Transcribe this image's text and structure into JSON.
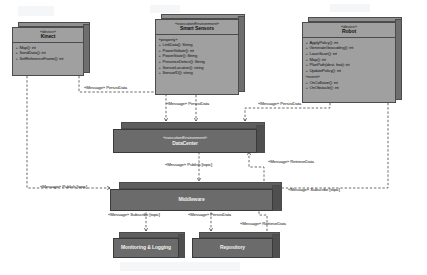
{
  "diagram": {
    "type": "uml-deployment",
    "palette": {
      "node_face": "#a0a0a0",
      "node_face_dark": "#6b6b6b",
      "node_top": "#8f8f8f",
      "node_side": "#6e6e6e",
      "outline": "#4b4b4b",
      "background": "#ffffff",
      "edge": "#2b2b2b"
    }
  },
  "nodes": [
    {
      "id": "kinect",
      "name": "Kinect",
      "stereotype": "«device»",
      "style": "light",
      "groups": [],
      "members": [
        "Map(): int",
        "SendData(): int",
        "SetReferenceFrame(): int"
      ]
    },
    {
      "id": "smart-sensors",
      "name": "Smart Sensors",
      "stereotype": "«executionEnvironment»",
      "style": "light",
      "groups": [
        {
          "label": "«property»",
          "members": [
            "LinkData(): String",
            "PowerVoltate(): int",
            "PowerState(): String",
            "PresenceDetect(): String",
            "SensorLocation(): string",
            "SensorID(): string"
          ]
        }
      ],
      "members": []
    },
    {
      "id": "robot",
      "name": "Robot",
      "stereotype": "«device»",
      "style": "light",
      "groups": [
        {
          "label": "",
          "members": [
            "ApplyPolicy(): int",
            "GenerateGeocoding(): int",
            "LaserScan(): int",
            "Map(): int",
            "PlanPath(dest, feat): int",
            "UpdatePolicy(): int"
          ]
        },
        {
          "label": "«event»",
          "members": [
            "OnCollision(): int",
            "OnObstacle(): int"
          ]
        }
      ],
      "members": []
    },
    {
      "id": "datacenter",
      "name": "DataCenter",
      "stereotype": "«executionEnvironment»",
      "style": "dark",
      "groups": [],
      "members": []
    },
    {
      "id": "middleware",
      "name": "Middleware",
      "stereotype": "",
      "style": "dark",
      "groups": [],
      "members": []
    },
    {
      "id": "monitoring",
      "name": "Monitoring & Logging",
      "stereotype": "",
      "style": "dark",
      "groups": [],
      "members": []
    },
    {
      "id": "repository",
      "name": "Repository",
      "stereotype": "",
      "style": "dark",
      "groups": [],
      "members": []
    }
  ],
  "edges": [
    {
      "id": "e1",
      "from": "kinect",
      "to": "datacenter",
      "label": "«Message» PersistData"
    },
    {
      "id": "e2",
      "from": "smart-sensors",
      "to": "datacenter",
      "label": "«Message» PersistData"
    },
    {
      "id": "e3",
      "from": "robot",
      "to": "datacenter",
      "label": "«Message» PersistData"
    },
    {
      "id": "e4",
      "from": "datacenter",
      "to": "middleware",
      "label": "«Message» Publish [topic]"
    },
    {
      "id": "e5",
      "from": "middleware",
      "to": "datacenter",
      "label": "«Message» RetrieveData"
    },
    {
      "id": "e6",
      "from": "kinect",
      "to": "middleware",
      "label": "«Message» Publish [topic]"
    },
    {
      "id": "e7",
      "from": "robot",
      "to": "middleware",
      "label": "«Message» Subscribe [topic]"
    },
    {
      "id": "e8",
      "from": "middleware",
      "to": "monitoring",
      "label": "«Message» Subscribe [topic]"
    },
    {
      "id": "e9",
      "from": "middleware",
      "to": "repository",
      "label": "«Message» PersistData"
    },
    {
      "id": "e10",
      "from": "repository",
      "to": "middleware",
      "label": "«Message» RetrieveData"
    }
  ]
}
